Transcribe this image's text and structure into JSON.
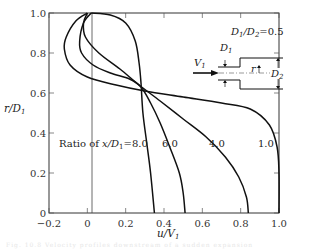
{
  "chart_data": {
    "type": "line",
    "title": "",
    "xlabel": "u/V1",
    "ylabel": "r/D1",
    "xlim": [
      -0.2,
      1.0
    ],
    "ylim": [
      0,
      1.0
    ],
    "xticks": [
      "-0.2",
      "0",
      "0.2",
      "0.4",
      "0.6",
      "0.8",
      "1.0"
    ],
    "yticks": [
      "0",
      "0.2",
      "0.4",
      "0.6",
      "0.8",
      "1.0"
    ],
    "grid": false,
    "legend": null,
    "annotations": {
      "ratio_prefix": "Ratio  of",
      "ratio_var": "x/D1",
      "labels": [
        "8.0",
        "6.0",
        "4.0",
        "1.0"
      ],
      "diameter_ratio": "D1/D2 = 0.5",
      "inset": {
        "inlet_velocity": "V1",
        "small_diameter": "D1",
        "large_diameter": "D2",
        "radius": "r"
      }
    },
    "series": [
      {
        "name": "x/D1 = 1.0",
        "points": [
          [
            0.0,
            1.0
          ],
          [
            -0.06,
            0.96
          ],
          [
            -0.11,
            0.88
          ],
          [
            -0.12,
            0.82
          ],
          [
            -0.09,
            0.74
          ],
          [
            0.0,
            0.68
          ],
          [
            0.15,
            0.64
          ],
          [
            0.3,
            0.61
          ],
          [
            0.5,
            0.58
          ],
          [
            0.7,
            0.55
          ],
          [
            0.85,
            0.52
          ],
          [
            0.95,
            0.44
          ],
          [
            0.99,
            0.33
          ],
          [
            1.0,
            0.2
          ],
          [
            1.0,
            0.0
          ]
        ]
      },
      {
        "name": "x/D1 = 4.0",
        "points": [
          [
            0.0,
            1.0
          ],
          [
            -0.02,
            0.95
          ],
          [
            -0.01,
            0.88
          ],
          [
            0.06,
            0.8
          ],
          [
            0.17,
            0.72
          ],
          [
            0.27,
            0.64
          ],
          [
            0.38,
            0.56
          ],
          [
            0.5,
            0.47
          ],
          [
            0.62,
            0.38
          ],
          [
            0.72,
            0.28
          ],
          [
            0.79,
            0.18
          ],
          [
            0.83,
            0.08
          ],
          [
            0.84,
            0.0
          ]
        ]
      },
      {
        "name": "x/D1 = 6.0",
        "points": [
          [
            0.02,
            1.0
          ],
          [
            -0.02,
            0.95
          ],
          [
            -0.04,
            0.86
          ],
          [
            -0.03,
            0.8
          ],
          [
            0.03,
            0.74
          ],
          [
            0.12,
            0.7
          ],
          [
            0.22,
            0.67
          ],
          [
            0.28,
            0.63
          ],
          [
            0.33,
            0.55
          ],
          [
            0.38,
            0.45
          ],
          [
            0.43,
            0.33
          ],
          [
            0.48,
            0.2
          ],
          [
            0.5,
            0.1
          ],
          [
            0.51,
            0.0
          ]
        ]
      },
      {
        "name": "x/D1 = 8.0",
        "points": [
          [
            0.02,
            1.0
          ],
          [
            0.12,
            0.99
          ],
          [
            0.2,
            0.95
          ],
          [
            0.25,
            0.86
          ],
          [
            0.27,
            0.75
          ],
          [
            0.28,
            0.65
          ],
          [
            0.29,
            0.5
          ],
          [
            0.31,
            0.35
          ],
          [
            0.33,
            0.2
          ],
          [
            0.35,
            0.0
          ]
        ]
      }
    ]
  },
  "caption": "Fig. 10.8  Velocity profiles downstream of a sudden expansion"
}
